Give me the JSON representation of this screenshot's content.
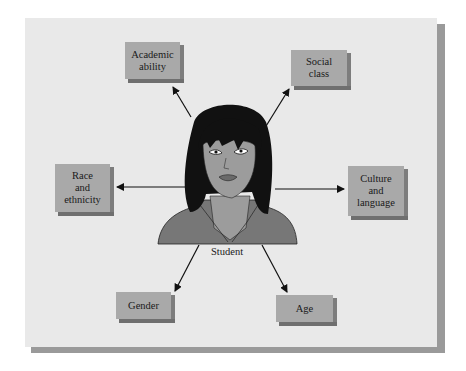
{
  "diagram": {
    "type": "hub-and-spoke",
    "center": {
      "label": "Student",
      "icon": "student-portrait"
    },
    "factors": [
      {
        "id": "academic-ability",
        "lines": [
          "Academic",
          "ability"
        ]
      },
      {
        "id": "social-class",
        "lines": [
          "Social",
          "class"
        ]
      },
      {
        "id": "race-ethnicity",
        "lines": [
          "Race",
          "and",
          "ethnicity"
        ]
      },
      {
        "id": "culture-language",
        "lines": [
          "Culture",
          "and",
          "language"
        ]
      },
      {
        "id": "gender",
        "lines": [
          "Gender"
        ]
      },
      {
        "id": "age",
        "lines": [
          "Age"
        ]
      }
    ]
  },
  "colors": {
    "panel": "#e9e9e9",
    "panel_shadow": "#9a9a9a",
    "box_face": "#a9a9a9",
    "box_side": "#7d7d7d",
    "hair": "#111111",
    "skin": "#9c9c9c",
    "jacket": "#777777"
  }
}
